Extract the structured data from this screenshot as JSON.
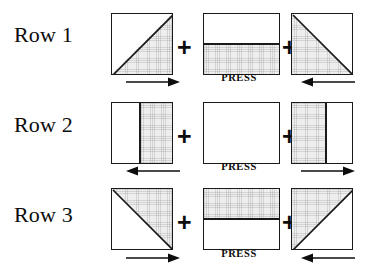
{
  "diagram": {
    "plus_symbol": "+",
    "press_label": "PRESS",
    "colors": {
      "ink": "#1a1a1a",
      "shaded_fabric": "#eeeeee",
      "background": "#ffffff"
    },
    "rows": [
      {
        "label": "Row 1",
        "press": "PRESS",
        "arrow_left": "arrow-right-icon",
        "arrow_right": "arrow-left-icon",
        "press_direction": "inward",
        "blocks": [
          {
            "name": "half-square-triangle-block",
            "shading": "tri-lower-right",
            "seam": "diagonal-bottom-left-to-top-right"
          },
          {
            "name": "two-bar-block",
            "shading": "half-bottom",
            "seam": "horizontal-center"
          },
          {
            "name": "half-square-triangle-block",
            "shading": "tri-lower-left",
            "seam": "diagonal-top-left-to-bottom-right"
          }
        ]
      },
      {
        "label": "Row 2",
        "press": "PRESS",
        "arrow_left": "arrow-left-icon",
        "arrow_right": "arrow-right-icon",
        "press_direction": "outward",
        "blocks": [
          {
            "name": "two-bar-block",
            "shading": "strip-right",
            "seam": "vertical-center"
          },
          {
            "name": "plain-block",
            "shading": "none",
            "seam": "none"
          },
          {
            "name": "two-bar-block",
            "shading": "strip-left",
            "seam": "vertical-center"
          }
        ]
      },
      {
        "label": "Row 3",
        "press": "PRESS",
        "arrow_left": "arrow-right-icon",
        "arrow_right": "arrow-left-icon",
        "press_direction": "inward",
        "blocks": [
          {
            "name": "half-square-triangle-block",
            "shading": "tri-upper-right",
            "seam": "diagonal-top-left-to-bottom-right"
          },
          {
            "name": "two-bar-block",
            "shading": "half-top",
            "seam": "horizontal-center"
          },
          {
            "name": "half-square-triangle-block",
            "shading": "tri-upper-left",
            "seam": "diagonal-bottom-left-to-top-right"
          }
        ]
      }
    ]
  }
}
